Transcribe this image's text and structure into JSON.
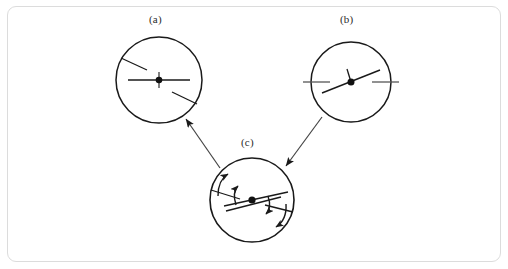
{
  "figure": {
    "kind": "physics-diagram",
    "background_color": "#ffffff",
    "frame": {
      "border_color": "#dcdcdc",
      "corner_radius": 9,
      "x": 7,
      "y": 6,
      "width": 494,
      "height": 256
    },
    "stroke_color": "#1a1a1a",
    "panels": [
      {
        "id": "a",
        "label": "(a)",
        "label_x": 149,
        "label_y": 13,
        "center_x": 159,
        "center_y": 80,
        "radius": 43,
        "center_dot": true,
        "vectors": [
          {
            "name": "horizontal-axis-line",
            "angle_deg": 0,
            "length": 62,
            "through_center": true
          }
        ],
        "edge_ticks": [
          {
            "name": "upper-left-tick",
            "angle_deg": 153,
            "inner_radius": 15,
            "outer_radius": 43
          },
          {
            "name": "lower-right-tick",
            "angle_deg": -27,
            "inner_radius": 15,
            "outer_radius": 43
          }
        ],
        "curved_arrows": []
      },
      {
        "id": "b",
        "label": "(b)",
        "label_x": 340,
        "label_y": 13,
        "center_x": 351,
        "center_y": 82,
        "radius": 40,
        "center_dot": true,
        "vectors": [
          {
            "name": "tilted-axis-line",
            "angle_deg": 19,
            "length": 62,
            "through_center": true
          },
          {
            "name": "short-vertical-stub",
            "angle_deg": 100,
            "length": 13,
            "through_center": false
          }
        ],
        "edge_ticks": [
          {
            "name": "left-edge-tick",
            "angle_deg": 180,
            "inner_radius": 25,
            "outer_radius": 48
          },
          {
            "name": "right-edge-tick",
            "angle_deg": 0,
            "inner_radius": 25,
            "outer_radius": 48
          }
        ],
        "curved_arrows": []
      },
      {
        "id": "c",
        "label": "(c)",
        "label_x": 241,
        "label_y": 136,
        "center_x": 252,
        "center_y": 200,
        "radius": 42,
        "center_dot": true,
        "vectors": [
          {
            "name": "tilted-axis-line-upper",
            "angle_deg": 12,
            "length": 64,
            "through_center": true
          },
          {
            "name": "tilted-axis-line-lower",
            "angle_deg": 8,
            "length": 58,
            "through_center": true
          }
        ],
        "edge_ticks": [
          {
            "name": "upper-left-tick",
            "angle_deg": 168,
            "inner_radius": 18,
            "outer_radius": 42
          },
          {
            "name": "lower-right-tick",
            "angle_deg": -9,
            "inner_radius": 20,
            "outer_radius": 42
          }
        ],
        "curved_arrows": [
          {
            "name": "precession-arrow-outer-left",
            "direction": "counterclockwise"
          },
          {
            "name": "precession-arrow-inner-left",
            "direction": "counterclockwise"
          },
          {
            "name": "precession-arrow-inner-right",
            "direction": "clockwise"
          },
          {
            "name": "precession-arrow-outer-right",
            "direction": "clockwise"
          }
        ]
      }
    ],
    "connector_arrows": [
      {
        "name": "arrow-c-to-a",
        "from_panel": "c",
        "to_panel": "a",
        "from_x": 220,
        "from_y": 168,
        "to_x": 186,
        "to_y": 119,
        "head_at": "to"
      },
      {
        "name": "arrow-b-to-c",
        "from_panel": "b",
        "to_panel": "c",
        "from_x": 322,
        "from_y": 117,
        "to_x": 286,
        "to_y": 166,
        "head_at": "to"
      }
    ]
  }
}
